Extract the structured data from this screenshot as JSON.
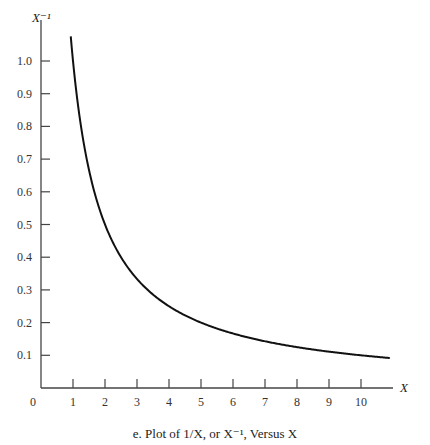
{
  "chart_data": {
    "type": "line",
    "title": "",
    "caption": "e. Plot of 1/X, or X⁻¹, Versus X",
    "xlabel": "X",
    "ylabel": "X⁻¹",
    "origin_label": "0",
    "x_ticks": [
      1,
      2,
      3,
      4,
      5,
      6,
      7,
      8,
      9,
      10
    ],
    "y_ticks": [
      0.1,
      0.2,
      0.3,
      0.4,
      0.5,
      0.6,
      0.7,
      0.8,
      0.9,
      1.0
    ],
    "y_tick_labels": [
      "0.1",
      "0.2",
      "0.3",
      "0.4",
      "0.5",
      "0.6",
      "0.7",
      "0.8",
      "0.9",
      "1.0"
    ],
    "xlim": [
      0,
      11
    ],
    "ylim": [
      0,
      1.1
    ],
    "grid": false,
    "legend": null,
    "series": [
      {
        "name": "1/X",
        "function": "y = 1/x",
        "x": [
          0.93,
          1,
          1.25,
          1.5,
          2,
          2.5,
          3,
          4,
          5,
          6,
          7,
          8,
          9,
          10,
          10.9
        ],
        "values": [
          1.075,
          1.0,
          0.8,
          0.667,
          0.5,
          0.4,
          0.333,
          0.25,
          0.2,
          0.167,
          0.143,
          0.125,
          0.111,
          0.1,
          0.092
        ]
      }
    ],
    "color": "#111111"
  }
}
